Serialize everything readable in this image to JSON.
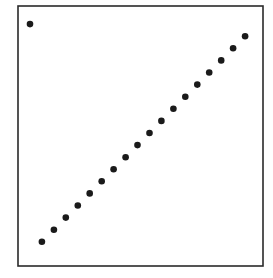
{
  "chart_data": {
    "type": "scatter",
    "title": "",
    "xlabel": "",
    "ylabel": "",
    "xlim": [
      -1,
      19.5
    ],
    "ylim": [
      -1,
      20.5
    ],
    "grid": false,
    "legend": null,
    "axis_ticks": false,
    "marker_color": "#1a1a1a",
    "series": [
      {
        "name": "points",
        "points": [
          {
            "x": 0,
            "y": 19
          },
          {
            "x": 1,
            "y": 1
          },
          {
            "x": 2,
            "y": 2
          },
          {
            "x": 3,
            "y": 3
          },
          {
            "x": 4,
            "y": 4
          },
          {
            "x": 5,
            "y": 5
          },
          {
            "x": 6,
            "y": 6
          },
          {
            "x": 7,
            "y": 7
          },
          {
            "x": 8,
            "y": 8
          },
          {
            "x": 9,
            "y": 9
          },
          {
            "x": 10,
            "y": 10
          },
          {
            "x": 11,
            "y": 11
          },
          {
            "x": 12,
            "y": 12
          },
          {
            "x": 13,
            "y": 13
          },
          {
            "x": 14,
            "y": 14
          },
          {
            "x": 15,
            "y": 15
          },
          {
            "x": 16,
            "y": 16
          },
          {
            "x": 17,
            "y": 17
          },
          {
            "x": 18,
            "y": 18
          }
        ]
      }
    ]
  }
}
